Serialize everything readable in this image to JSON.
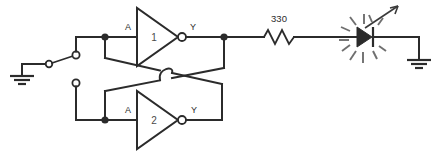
{
  "diagram": {
    "background_color": "#ffffff",
    "line_color": "#2b2b2b"
  },
  "components": {
    "ground_left": {
      "name": "ground-symbol-left",
      "label": ""
    },
    "switch": {
      "name": "spdt-switch",
      "label": "",
      "position": "upper",
      "terminal_upper_label": "",
      "terminal_lower_label": ""
    },
    "gate1": {
      "name": "inverter-gate-1",
      "number": "1",
      "input_label": "A",
      "output_label": "Y"
    },
    "gate2": {
      "name": "inverter-gate-2",
      "number": "2",
      "input_label": "A",
      "output_label": "Y"
    },
    "resistor": {
      "name": "resistor",
      "value": "330"
    },
    "led": {
      "name": "led",
      "label": ""
    },
    "ground_right": {
      "name": "ground-symbol-right",
      "label": ""
    }
  }
}
